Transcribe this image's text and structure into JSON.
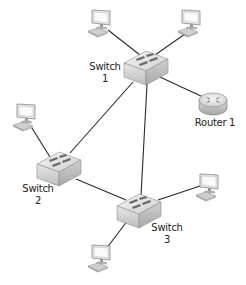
{
  "diagram": {
    "type": "network-topology",
    "colors": {
      "link": "#2a2a2a",
      "device_light": "#f2f2f2",
      "device_mid": "#d4d4d4",
      "device_dark": "#9a9a9a",
      "port": "#6a6a6a",
      "screen": "#f7f7f7",
      "text": "#222222"
    },
    "nodes": [
      {
        "id": "switch1",
        "kind": "switch",
        "label_line1": "Switch",
        "label_line2": "1"
      },
      {
        "id": "switch2",
        "kind": "switch",
        "label_line1": "Switch",
        "label_line2": "2"
      },
      {
        "id": "switch3",
        "kind": "switch",
        "label_line1": "Switch",
        "label_line2": "3"
      },
      {
        "id": "router1",
        "kind": "router",
        "label_line1": "Router 1"
      },
      {
        "id": "pc-top-left",
        "kind": "computer"
      },
      {
        "id": "pc-top-right",
        "kind": "computer"
      },
      {
        "id": "pc-left",
        "kind": "computer"
      },
      {
        "id": "pc-right",
        "kind": "computer"
      },
      {
        "id": "pc-bottom",
        "kind": "computer"
      }
    ],
    "links": [
      {
        "from": "pc-top-left",
        "to": "switch1"
      },
      {
        "from": "pc-top-right",
        "to": "switch1"
      },
      {
        "from": "switch1",
        "to": "router1"
      },
      {
        "from": "switch1",
        "to": "switch2"
      },
      {
        "from": "switch1",
        "to": "switch3"
      },
      {
        "from": "pc-left",
        "to": "switch2"
      },
      {
        "from": "switch2",
        "to": "switch3"
      },
      {
        "from": "switch3",
        "to": "pc-right"
      },
      {
        "from": "switch3",
        "to": "pc-bottom"
      }
    ]
  }
}
